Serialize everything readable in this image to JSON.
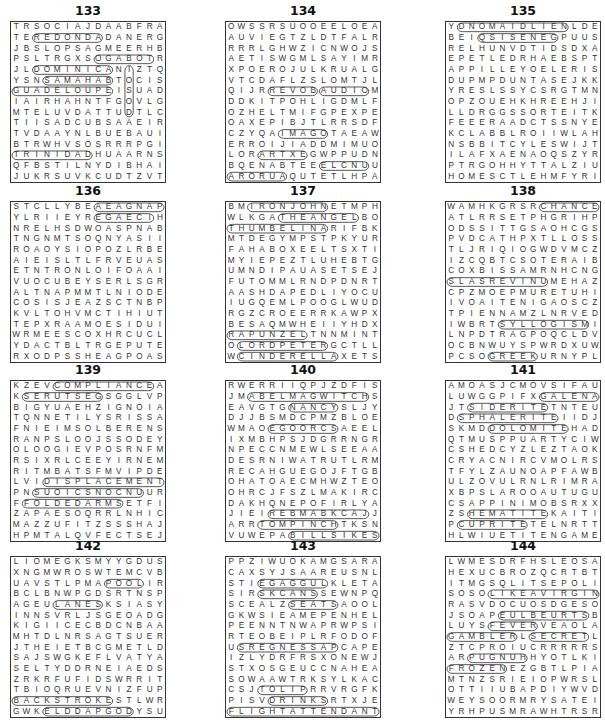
{
  "puzzles": [
    {
      "number": "133",
      "rows": [
        "TRSOCIAJDAABFRA",
        "TEREDONDADANERG",
        "JBSLOPSAGMEERHB",
        "PSLTRGXSOGABOTR",
        "JLDOMINICANIZTQ",
        "YSNSAMAHABTOCIS",
        "GUADELOUPEISUAD",
        "IAIRHAHNTFGOVLG",
        "MTELUVDATTUDTLC",
        "TIISADCUBSAAEIR",
        "TVDAAYNLBUEBAUI",
        "BTRWHVSOSRRRPGI",
        "TRINIDADHUAARNS",
        "QFBSTILNYDIBHAI",
        "JUKRSUVKCUDTZVT"
      ],
      "answers": [
        {
          "word": "REDONDA",
          "r": 1,
          "c": 2,
          "dr": 0,
          "dc": 1
        },
        {
          "word": "TOBAGO",
          "r": 3,
          "c": 13,
          "dr": 0,
          "dc": -1
        },
        {
          "word": "DOMINICA",
          "r": 4,
          "c": 2,
          "dr": 0,
          "dc": 1
        },
        {
          "word": "BAHAMAS",
          "r": 5,
          "c": 9,
          "dr": 0,
          "dc": -1
        },
        {
          "word": "GUADELOUPE",
          "r": 6,
          "c": 0,
          "dr": 0,
          "dc": 1
        },
        {
          "word": "TRINIDAD",
          "r": 12,
          "c": 0,
          "dr": 0,
          "dc": 1
        },
        {
          "word": "NITUA",
          "r": 4,
          "c": 11,
          "dr": 1,
          "dc": 0
        }
      ]
    },
    {
      "number": "134",
      "rows": [
        "OWSSRSUOOEELOEA",
        "AUVIEGTZLDTFALR",
        "RRRLGHWZICNWOJS",
        "AETISWGMLSAYIMR",
        "XPOERojULKRUALG",
        "VTCDAFLZSLOMTJL",
        "QIJRREVOBAUDIOM",
        "DDKITPOHLIGDMLF",
        "OZHELTMIFGPEXPE",
        "OAXEPIBJTLRRSDF",
        "CZYQAIMAGOTAEAW",
        "ERROIJIADDMIMUO",
        "LORARTXEGWPPUDN",
        "BQENABTEEELCNUU",
        "ARORUAQUTETLHPA"
      ],
      "answers": [
        {
          "word": "AUDIO",
          "r": 6,
          "c": 9,
          "dr": 0,
          "dc": 1
        },
        {
          "word": "BOVER",
          "r": 6,
          "c": 8,
          "dr": 0,
          "dc": -1
        },
        {
          "word": "IMAGO",
          "r": 10,
          "c": 5,
          "dr": 0,
          "dc": 1
        },
        {
          "word": "ARTXE",
          "r": 12,
          "c": 3,
          "dr": 0,
          "dc": 1
        },
        {
          "word": "AURORA",
          "r": 14,
          "c": 5,
          "dr": 0,
          "dc": -1
        },
        {
          "word": "ELCNU",
          "r": 13,
          "c": 9,
          "dr": 0,
          "dc": 1
        }
      ]
    },
    {
      "number": "135",
      "rows": [
        "YDNOMAIDLIENLDE",
        "BEIQSISENEGPUUS",
        "RELHUNVDTIDSDXA",
        "EPETLEDRHAEBSPT",
        "APPILLEYOELERIS",
        "DUPMPDUNTASEJKK",
        "YRESLSSYCSRGTMN",
        "OPZOUEHKHREEHJI",
        "LLDRGGSSORTEITK",
        "FEEERAADCTSSNYE",
        "KCLABBLROIIWLAH",
        "NSBBITCYLESWIJT",
        "ILAFXAENAOQSZYR",
        "PTRGOHHYTTALZIU",
        "HOMESCTLEHMFYRI"
      ],
      "answers": [
        {
          "word": "DNOMAIDLIEN",
          "r": 0,
          "c": 1,
          "dr": 0,
          "dc": 1
        },
        {
          "word": "QSISENEG",
          "r": 1,
          "c": 3,
          "dr": 0,
          "dc": 1
        }
      ]
    },
    {
      "number": "136",
      "rows": [
        "STCLLYBEAEAGNAP",
        "YLRIIEYREGAECIH",
        "NRELHSDWOASPNAB",
        "TNGNMTSOQNYASII",
        "ROAOYSIOPOZLRBE",
        "AIEISLTLFRVEUAS",
        "ETNTRONLOIFOAAI",
        "VUOCUBEYSERLSGR",
        "ALTNAPMMTLNIODE",
        "COSISJEAZSCTNBP",
        "KVLTOHVMCTIHIUT",
        "TEPXRAAMOESIDUI",
        "WRMEESCOXHRCUCL",
        "YDACTBLTRGEPUTE",
        "RXODPSSHEAGPOAS"
      ],
      "answers": [
        {
          "word": "AEAGNAP",
          "r": 0,
          "c": 8,
          "dr": 0,
          "dc": 1
        },
        {
          "word": "EGAECI",
          "r": 1,
          "c": 8,
          "dr": 0,
          "dc": 1
        }
      ]
    },
    {
      "number": "137",
      "rows": [
        "BMIRONJOHNETMPH",
        "WLKGATHEANGELBO",
        "THUMBELINARIFBK",
        "MTDEGYMPSTPKYUR",
        "FAHABOXEELTSXTI",
        "MYIEPEZTLUHEBTG",
        "UMNDIPAUASETSEJ",
        "FUTOMMLRNDPDNRT",
        "AASHDAPEDLIYOCU",
        "IUGQEMLPOOGLWUD",
        "RGZCROEERRKAWPX",
        "BESAQMWHEIIYHDX",
        "RAPUNZELTNNMINT",
        "OLORDPETERGCTLL",
        "WCINDERELLAXETS"
      ],
      "answers": [
        {
          "word": "IRONJOHN",
          "r": 0,
          "c": 2,
          "dr": 0,
          "dc": 1
        },
        {
          "word": "THEANGEL",
          "r": 1,
          "c": 5,
          "dr": 0,
          "dc": 1
        },
        {
          "word": "THUMBELINA",
          "r": 2,
          "c": 0,
          "dr": 0,
          "dc": 1
        },
        {
          "word": "RAPUNZEL",
          "r": 12,
          "c": 0,
          "dr": 0,
          "dc": 1
        },
        {
          "word": "LORDPETER",
          "r": 13,
          "c": 1,
          "dr": 0,
          "dc": 1
        },
        {
          "word": "CINDERELLA",
          "r": 14,
          "c": 1,
          "dr": 0,
          "dc": 1
        }
      ]
    },
    {
      "number": "138",
      "rows": [
        "WAMHKGRSRCHANCE",
        "ATLRRSETPHGRIHP",
        "ODSSITTGSAOHCGS",
        "PVDCATHPXTLLOSS",
        "TLJRIQIOGWDVMCZ",
        "IZCQBTCSOTERAIB",
        "COXBISSAMRNHCNG",
        "SLASREVINUMEHAZ",
        "CPZMOEPMURETUHI",
        "IVOAITENIGAOSCZ",
        "TPIENNAMZLNRVED",
        "IWBRTSYLLOGISMI",
        "LNPDTRAGPOQCLDV",
        "OCBNWUYSPWRDXUW",
        "PCSOGREEKURNYPL"
      ],
      "answers": [
        {
          "word": "CHANCE",
          "r": 0,
          "c": 9,
          "dr": 0,
          "dc": 1
        },
        {
          "word": "SLASREVINU",
          "r": 7,
          "c": 0,
          "dr": 0,
          "dc": 1
        },
        {
          "word": "SYLLOGISM",
          "r": 11,
          "c": 5,
          "dr": 0,
          "dc": 1
        },
        {
          "word": "GREEK",
          "r": 14,
          "c": 4,
          "dr": 0,
          "dc": 1
        }
      ]
    },
    {
      "number": "139",
      "rows": [
        "KZEVCOMPLIANCEA",
        "KSERUTSEGSGGLVP",
        "BIGYUAEHZIGNOIA",
        "TQNNETILYSRISSA",
        "FNIEIMSOLBERENS",
        "RANPSLOOJSSODEY",
        "OLOOGIEVPOSRNFM",
        "RSIXRLCEEYIRNEM",
        "RITMBATSFMVIPDE",
        "LVIDISPLACEMENT",
        "PNSUOICSNOCNUUR",
        "FFOLDEDARMSETFI",
        "ZAPAESOQRRLNHIC",
        "MAZZUFITZSSSHAJ",
        "HPMTALQVFECTSEJ"
      ],
      "answers": [
        {
          "word": "COMPLIANCE",
          "r": 0,
          "c": 4,
          "dr": 0,
          "dc": 1
        },
        {
          "word": "SERUTSEG",
          "r": 1,
          "c": 1,
          "dr": 0,
          "dc": 1
        },
        {
          "word": "DISPLACEMENT",
          "r": 9,
          "c": 3,
          "dr": 0,
          "dc": 1
        },
        {
          "word": "SUOICSNOCNU",
          "r": 10,
          "c": 2,
          "dr": 0,
          "dc": 1
        },
        {
          "word": "FOLDEDARMS",
          "r": 11,
          "c": 1,
          "dr": 0,
          "dc": 1
        }
      ]
    },
    {
      "number": "140",
      "rows": [
        "RWERRIIQPJZDFIS",
        "JMABELMAGWITCHS",
        "EAVGTGNANCYSLJY",
        "DJJBSMDCPMZBLOE",
        "WMAOEGOORCSAEEL",
        "IXMBHPSJDGRRNGR",
        "NPECCNMEWLSEEAA",
        "DESRNIWATRUTLRM",
        "RECAHGUEGOJFTGB",
        "OHATOAECMHWZTEO",
        "OHRCJFSZLMAKIRC",
        "DAKHQNEPOFIRLYA",
        "JIEIREBMABKCAJJ",
        "ARRTOMPINCHTKSN",
        "VUWEPABILLSIKES"
      ],
      "answers": [
        {
          "word": "ABELMAGWITCH",
          "r": 1,
          "c": 2,
          "dr": 0,
          "dc": 1
        },
        {
          "word": "NANCY",
          "r": 2,
          "c": 6,
          "dr": 0,
          "dc": 1
        },
        {
          "word": "EGOORCS",
          "r": 4,
          "c": 4,
          "dr": 0,
          "dc": 1
        },
        {
          "word": "REBMABKCAJ",
          "r": 12,
          "c": 4,
          "dr": 0,
          "dc": 1
        },
        {
          "word": "TOMPINCH",
          "r": 13,
          "c": 3,
          "dr": 0,
          "dc": 1
        },
        {
          "word": "BILLSIKES",
          "r": 14,
          "c": 6,
          "dr": 0,
          "dc": 1
        }
      ]
    },
    {
      "number": "141",
      "rows": [
        "AMOASJCMOVSIFAU",
        "LUWGGPIFXGALENA",
        "JTSIDERITETNTEU",
        "DSPHALERITEIIDJ",
        "SKMDDOLOMITEHAD",
        "QTMUSPPUARTYCIW",
        "CSHEDCYZLEZTAOK",
        "CRYACNIRCVMOLRS",
        "TFYLZAUNOAPFAWB",
        "ULZOVULRNLRIMRA",
        "XBPSLAROOAUTUGU",
        "CSAPPINIMOBSRXX",
        "ZSHEMATITEKAITI",
        "PCUPRITETELNRTT",
        "HLWIUETITENGAME"
      ],
      "answers": [
        {
          "word": "GALENA",
          "r": 1,
          "c": 9,
          "dr": 0,
          "dc": 1
        },
        {
          "word": "SIDERITE",
          "r": 2,
          "c": 2,
          "dr": 0,
          "dc": 1
        },
        {
          "word": "SPHALERITE",
          "r": 3,
          "c": 1,
          "dr": 0,
          "dc": 1
        },
        {
          "word": "DOLOMITE",
          "r": 4,
          "c": 4,
          "dr": 0,
          "dc": 1
        },
        {
          "word": "HEMATITE",
          "r": 12,
          "c": 2,
          "dr": 0,
          "dc": 1
        },
        {
          "word": "CUPRITE",
          "r": 13,
          "c": 1,
          "dr": 0,
          "dc": 1
        }
      ]
    },
    {
      "number": "142",
      "rows": [
        "LIOMEGKSMYYGDUS",
        "XNGMWROSWTEMCVB",
        "UAVSTLPMAPOOLIR",
        "BCLBNWPGDSRTNSP",
        "AGEULANESKSIASY",
        "INNSVRLJSGEOADG",
        "KIGIICECBDCNBAA",
        "MHTDLNRSAGTSUER",
        "JTHEIETBCGMETLD",
        "SAJSWGKEFLVATYA",
        "SELTYDDRNEIAEDS",
        "ZRKRFUFIDSWRRIT",
        "TBIOQRUEVNIZFUP",
        "BACKSTROKESTLWR",
        "GWKELDDAPGODYSU"
      ],
      "answers": [
        {
          "word": "POOL",
          "r": 2,
          "c": 9,
          "dr": 0,
          "dc": 1
        },
        {
          "word": "LANES",
          "r": 4,
          "c": 4,
          "dr": 0,
          "dc": 1
        },
        {
          "word": "BACKSTROKE",
          "r": 13,
          "c": 0,
          "dr": 0,
          "dc": 1
        },
        {
          "word": "ELDDAPGOD",
          "r": 14,
          "c": 3,
          "dr": 0,
          "dc": 1
        }
      ]
    },
    {
      "number": "143",
      "rows": [
        "PPZIWUOKAMGSARA",
        "CAXSYJSAAREUSNL",
        "STIEGAGGULKLETA",
        "SIRSKCANSSEWNPQ",
        "SCEALZSEATSAOOL",
        "GKWSIEAMEPENHEL",
        "PEENNTNWAPRWPSI",
        "RTEOBEIPLRFODOF",
        "USREGNESSAPCAPE",
        "IZLYDRFRSXONEWJ",
        "STXOSGEUCCNAHEA",
        "SOWAAWTRKSYLKAC",
        "CSJTOLIPRRVRGFK",
        "PISVDRINKSRTXJE",
        "FLIGHTATTENDANT"
      ],
      "answers": [
        {
          "word": "LUGGAGE",
          "r": 2,
          "c": 9,
          "dr": 0,
          "dc": -1
        },
        {
          "word": "SKCANS",
          "r": 3,
          "c": 3,
          "dr": 0,
          "dc": 1
        },
        {
          "word": "SEATS",
          "r": 4,
          "c": 6,
          "dr": 0,
          "dc": 1
        },
        {
          "word": "SREGNESSAP",
          "r": 8,
          "c": 1,
          "dr": 0,
          "dc": 1
        },
        {
          "word": "TOLIP",
          "r": 12,
          "c": 3,
          "dr": 0,
          "dc": 1
        },
        {
          "word": "DRINKS",
          "r": 13,
          "c": 4,
          "dr": 0,
          "dc": 1
        },
        {
          "word": "FLIGHTATTENDANT",
          "r": 14,
          "c": 0,
          "dr": 0,
          "dc": 1
        }
      ]
    },
    {
      "number": "144",
      "rows": [
        "LWMESDRFHSLEOSA",
        "HEXUCBROZQCRTBT",
        "ITMGSQLITSEPOLI",
        "SOSOLIKEAVIRGIN",
        "RASVDOCUOSDGESO",
        "JSOAPEULBEURTSB",
        "LUYSFEVERVEAOLA",
        "GAMBLERLSECRETL",
        "ZTCPROIUCRRRRRS",
        "ARPUGNUHHYOTLKI",
        "FROZENEZGBTLPIA",
        "MTNZSRIEIOPWRSL",
        "OTTIIUBAPDIYWVD",
        "WEYSOORMRYSATEI",
        "YRHPUSMRAWHTRSR"
      ],
      "answers": [
        {
          "word": "LIKEAVIRGIN",
          "r": 3,
          "c": 4,
          "dr": 0,
          "dc": 1
        },
        {
          "word": "EULBEURTS",
          "r": 5,
          "c": 5,
          "dr": 0,
          "dc": 1
        },
        {
          "word": "FEVER",
          "r": 6,
          "c": 4,
          "dr": 0,
          "dc": 1
        },
        {
          "word": "GAMBLER",
          "r": 7,
          "c": 0,
          "dr": 0,
          "dc": 1
        },
        {
          "word": "SECRET",
          "r": 7,
          "c": 8,
          "dr": 0,
          "dc": 1
        },
        {
          "word": "PUGNUH",
          "r": 9,
          "c": 2,
          "dr": 0,
          "dc": 1
        },
        {
          "word": "FROZEN",
          "r": 10,
          "c": 0,
          "dr": 0,
          "dc": 1
        }
      ]
    }
  ],
  "layout": {
    "col_x": [
      10,
      225,
      445
    ],
    "row_y": [
      21,
      201,
      380,
      556
    ],
    "grid_w": 156,
    "grid_h": 162
  }
}
